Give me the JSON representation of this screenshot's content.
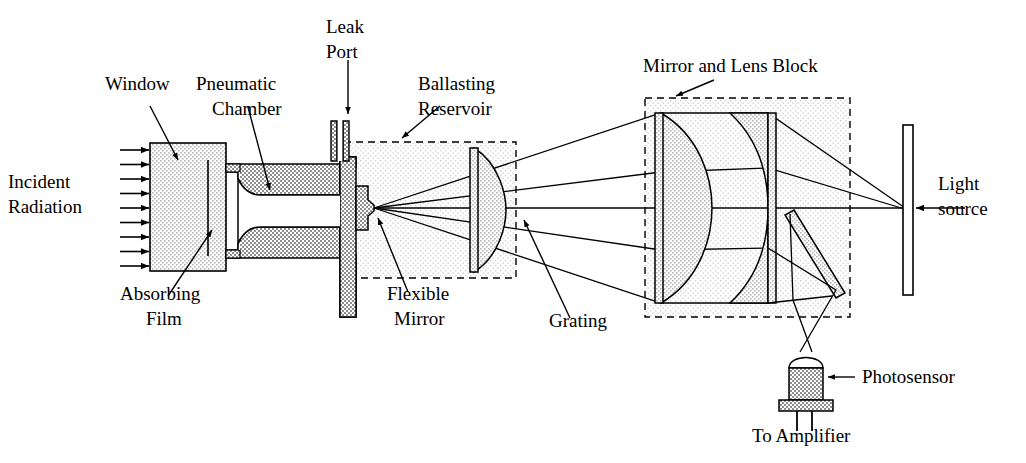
{
  "figure": {
    "type": "cross-section-diagram",
    "width": 1026,
    "height": 463,
    "background": "#ffffff",
    "line_color": "#000000"
  },
  "colors": {
    "stroke": "#000000",
    "metal_fill": "#9a9a9a",
    "glass_fill": "#c9c9c9",
    "light_fill": "#ebebeb",
    "window_fill": "#dcdcdc",
    "white": "#ffffff",
    "reservoir_fill": "#ececec",
    "block_fill": "#e4e4e4"
  },
  "labels": {
    "incident_radiation": {
      "text": "Incident\nRadiation",
      "lines": [
        "Incident",
        "Radiation"
      ],
      "x": 8,
      "y": 188
    },
    "window": {
      "text": "Window",
      "lines": [
        "Window"
      ],
      "x": 105,
      "y": 90
    },
    "pneumatic_chamber": {
      "text": "Pneumatic Chamber",
      "lines": [
        "Pneumatic",
        "Chamber"
      ],
      "x": 196,
      "y": 90
    },
    "leak_port": {
      "text": "Leak Port",
      "lines": [
        "Leak",
        "Port"
      ],
      "x": 322,
      "y": 33
    },
    "ballasting_reservoir": {
      "text": "Ballasting Reservoir",
      "lines": [
        "Ballasting",
        "Reservoir"
      ],
      "x": 418,
      "y": 90
    },
    "mirror_and_lens_block": {
      "text": "Mirror and Lens Block",
      "lines": [
        "Mirror and Lens Block"
      ],
      "x": 643,
      "y": 72
    },
    "light_source": {
      "text": "Light source",
      "lines": [
        "Light",
        "source"
      ],
      "x": 938,
      "y": 190
    },
    "absorbing_film": {
      "text": "Absorbing Film",
      "lines": [
        "Absorbing",
        "Film"
      ],
      "x": 140,
      "y": 300
    },
    "flexible_mirror": {
      "text": "Flexible Mirror",
      "lines": [
        "Flexible",
        "Mirror"
      ],
      "x": 387,
      "y": 300
    },
    "grating": {
      "text": "Grating",
      "lines": [
        "Grating"
      ],
      "x": 549,
      "y": 327
    },
    "photosensor": {
      "text": "Photosensor",
      "lines": [
        "Photosensor"
      ],
      "x": 862,
      "y": 383
    },
    "to_amplifier": {
      "text": "To Amplifier",
      "lines": [
        "To Amplifier"
      ],
      "x": 752,
      "y": 442
    }
  },
  "components": {
    "window_block": {
      "name": "Window",
      "x": 150,
      "y": 143,
      "width": 76,
      "height": 128
    },
    "absorbing_film_line": {
      "name": "Absorbing Film",
      "x": 208,
      "y1": 160,
      "y2": 256
    },
    "incident_arrows": {
      "count": 9,
      "x_start": 120,
      "x_end": 150,
      "y_first": 150,
      "y_last": 266
    },
    "pneumatic_chamber_body": {
      "name": "Pneumatic Chamber",
      "x": 226,
      "y": 157,
      "width": 130,
      "height": 160
    },
    "leak_port": {
      "name": "Leak Port",
      "x": 337,
      "y": 121,
      "width": 12,
      "height": 40
    },
    "flexible_mirror_vertex": {
      "name": "Flexible Mirror",
      "x": 374,
      "y": 208
    },
    "ballasting_reservoir_box": {
      "name": "Ballasting Reservoir",
      "x": 344,
      "y": 142,
      "width": 172,
      "height": 136,
      "border": "dashed"
    },
    "grating_lens": {
      "name": "Grating",
      "x": 478,
      "y_top": 148,
      "y_bottom": 272,
      "bulge": 28,
      "shape": "plano-convex"
    },
    "mirror_lens_block_box": {
      "name": "Mirror and Lens Block",
      "x": 645,
      "y": 98,
      "width": 205,
      "height": 219,
      "border": "dashed"
    },
    "lens_left": {
      "name": "lens-1",
      "x": 661,
      "y_top": 113,
      "y_bottom": 303,
      "shape": "plano-convex"
    },
    "lens_right": {
      "name": "lens-2",
      "x": 768,
      "y_top": 113,
      "y_bottom": 303,
      "shape": "convex-plano"
    },
    "tilted_mirror": {
      "name": "fold mirror",
      "x1": 796,
      "y1": 212,
      "x2": 842,
      "y2": 290,
      "thickness": 10
    },
    "light_source_bar": {
      "name": "Light source",
      "x": 903,
      "y": 125,
      "width": 10,
      "height": 170
    },
    "photosensor": {
      "name": "Photosensor",
      "x": 789,
      "y": 355,
      "width": 34,
      "height": 45,
      "leads": 2
    }
  }
}
